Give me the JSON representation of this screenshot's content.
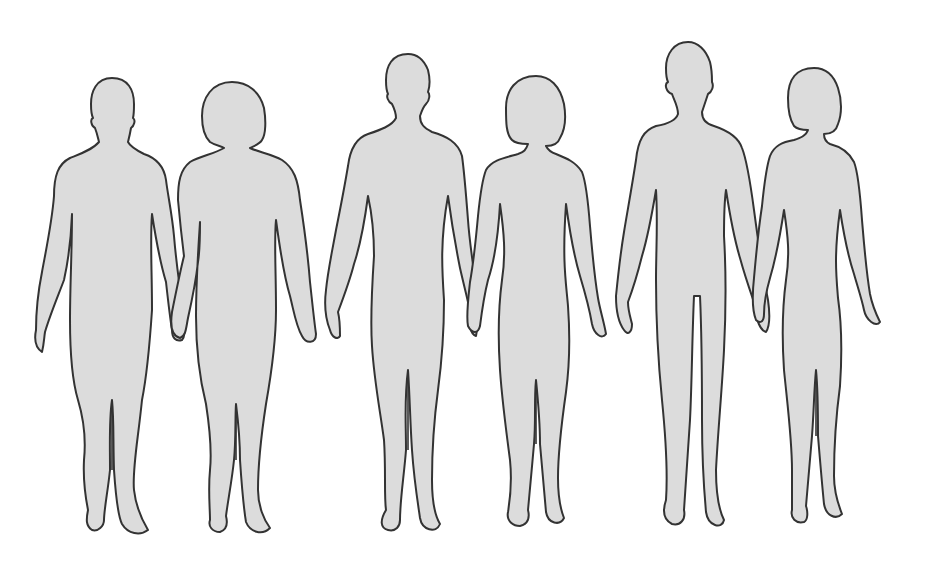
{
  "diagram": {
    "description": "Six human silhouettes arranged as three male-female pairs holding hands",
    "fill_color": "#dcdcdc",
    "outline_color": "#333333",
    "background": "#ffffff",
    "pairs": [
      {
        "name": "heavy pair",
        "figures": [
          "male",
          "female"
        ]
      },
      {
        "name": "average pair",
        "figures": [
          "male",
          "female"
        ]
      },
      {
        "name": "slim pair",
        "figures": [
          "male",
          "female"
        ]
      }
    ]
  }
}
